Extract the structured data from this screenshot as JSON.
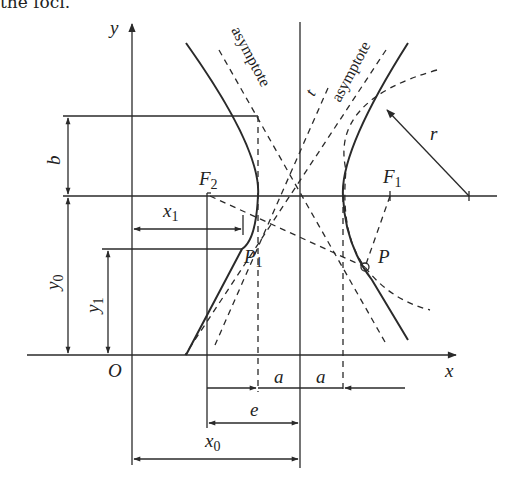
{
  "caption": "the foci.",
  "diagram": {
    "axes": {
      "x_label": "x",
      "y_label": "y",
      "origin_label": "O"
    },
    "points": {
      "focus_left": {
        "label": "F",
        "sub": "2"
      },
      "focus_right": {
        "label": "F",
        "sub": "1"
      },
      "point_p": {
        "label": "P"
      },
      "point_p1": {
        "label": "P",
        "sub": "1"
      }
    },
    "lines": {
      "asymptote_left": "asymptote",
      "asymptote_right": "asymptote",
      "tangent": "t"
    },
    "dimensions": {
      "b": "b",
      "y0": {
        "label": "y",
        "sub": "0"
      },
      "y1": {
        "label": "y",
        "sub": "1"
      },
      "x1": {
        "label": "x",
        "sub": "1"
      },
      "x0": {
        "label": "x",
        "sub": "0"
      },
      "a_left": "a",
      "a_right": "a",
      "e": "e",
      "r": "r"
    },
    "colors": {
      "stroke": "#2a2a2a",
      "background": "#ffffff"
    }
  }
}
